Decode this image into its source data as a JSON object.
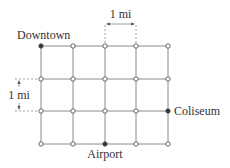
{
  "diagram": {
    "type": "street-grid-map",
    "columns": 5,
    "rows": 4,
    "labels": {
      "downtown": "Downtown",
      "coliseum": "Coliseum",
      "airport": "Airport",
      "scale_horizontal": "1 mi",
      "scale_vertical": "1 mi"
    },
    "highlighted_nodes": [
      {
        "name": "Downtown",
        "col": 0,
        "row": 0
      },
      {
        "name": "Coliseum",
        "col": 4,
        "row": 2
      },
      {
        "name": "Airport",
        "col": 2,
        "row": 3
      }
    ],
    "colors": {
      "grid_line": "#8a8a8a",
      "node_open": "#ffffff",
      "node_stroke": "#555555",
      "node_filled": "#333333",
      "text": "#333333"
    }
  }
}
